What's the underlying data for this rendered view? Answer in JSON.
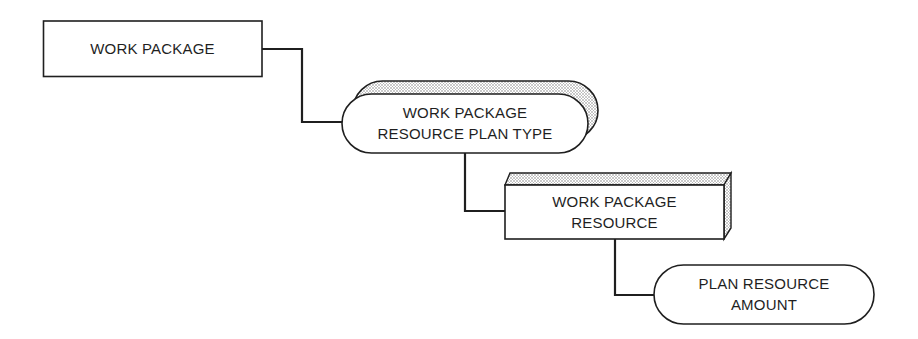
{
  "diagram": {
    "type": "entity-hierarchy",
    "colors": {
      "stroke": "#1f1f1f",
      "background": "#ffffff",
      "shading": "#9a9a9a"
    },
    "nodes": [
      {
        "id": "work-package",
        "shape": "rectangle",
        "lines": [
          "WORK PACKAGE"
        ]
      },
      {
        "id": "work-package-resource-plan-type",
        "shape": "rounded-pill-3d-shaded",
        "lines": [
          "WORK PACKAGE",
          "RESOURCE PLAN TYPE"
        ]
      },
      {
        "id": "work-package-resource",
        "shape": "rectangle-3d-shaded",
        "lines": [
          "WORK PACKAGE",
          "RESOURCE"
        ]
      },
      {
        "id": "plan-resource-amount",
        "shape": "rounded-pill",
        "lines": [
          "PLAN RESOURCE",
          "AMOUNT"
        ]
      }
    ],
    "edges": [
      {
        "from": "work-package",
        "to": "work-package-resource-plan-type"
      },
      {
        "from": "work-package-resource-plan-type",
        "to": "work-package-resource"
      },
      {
        "from": "work-package-resource",
        "to": "plan-resource-amount"
      }
    ]
  }
}
